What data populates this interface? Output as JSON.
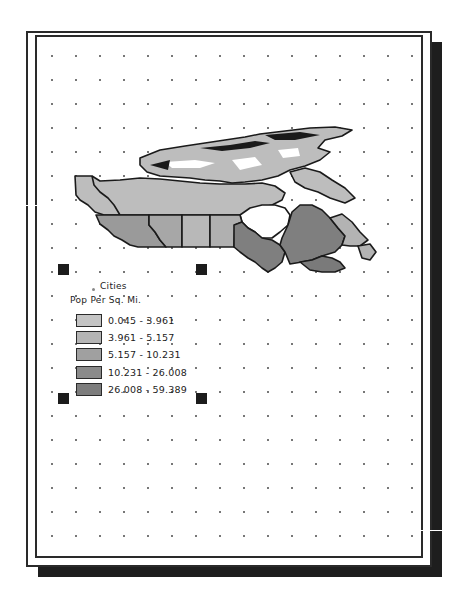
{
  "layout_view": {
    "page": {
      "background": "#ffffff",
      "border_color": "#2a2a2a",
      "shadow_color": "#1e1e1e"
    }
  },
  "map": {
    "subject": "Canada provinces choropleth",
    "colors": {
      "class1": "#bdbdbd",
      "class2": "#b3b3b3",
      "class3": "#9a9a9a",
      "class4": "#878787",
      "class5": "#7a7a7a",
      "outline": "#1a1a1a"
    }
  },
  "legend": {
    "cities_label": "Cities",
    "title": "Pop Per Sq. Mi.",
    "classes": [
      {
        "label": "0.045 - 3.961",
        "color": "#c4c4c4"
      },
      {
        "label": "3.961 - 5.157",
        "color": "#b5b5b5"
      },
      {
        "label": "5.157 - 10.231",
        "color": "#a0a0a0"
      },
      {
        "label": "10.231 - 26.008",
        "color": "#8a8a8a"
      },
      {
        "label": "26.008 - 59.389",
        "color": "#7d7d7d"
      }
    ]
  },
  "selection": {
    "handles": [
      "top-left",
      "top-right",
      "bottom-left",
      "bottom-right"
    ]
  }
}
